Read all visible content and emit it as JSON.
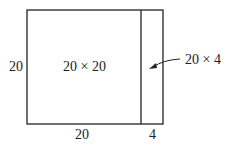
{
  "diagram": {
    "left_label": "20",
    "big_area_label": "20 × 20",
    "strip_label": "20 × 4",
    "bottom_left_label": "20",
    "bottom_right_label": "4"
  }
}
